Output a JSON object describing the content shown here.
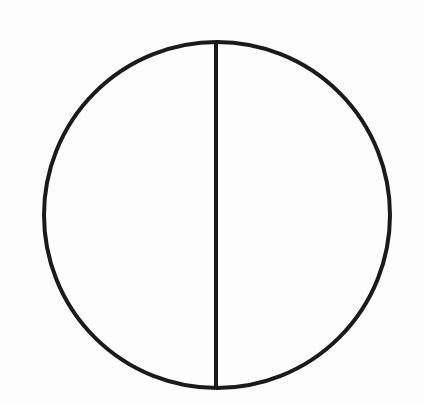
{
  "diagram": {
    "background_color": "#fdfdfd",
    "stroke_color": "#1a1a1a",
    "stroke_width": 4,
    "circle": {
      "cx": 217,
      "cy": 215,
      "r": 173
    },
    "divider": {
      "x": 216,
      "y1": 42,
      "y2": 388
    },
    "parts": 2
  }
}
